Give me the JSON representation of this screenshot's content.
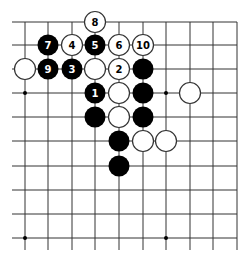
{
  "diagram": {
    "type": "go-board-fragment",
    "grid": {
      "columns_x": [
        25,
        48,
        72,
        95,
        119,
        143,
        166,
        190,
        213,
        237
      ],
      "rows_y": [
        22,
        45,
        69,
        93,
        117,
        141,
        166,
        190,
        214,
        238
      ],
      "line_extend_left": 12,
      "line_extend_bottom": 250,
      "line_color": "#333333"
    },
    "star_points": [
      {
        "col": 0,
        "row": 3
      },
      {
        "col": 6,
        "row": 3
      },
      {
        "col": 0,
        "row": 9
      },
      {
        "col": 6,
        "row": 9
      }
    ],
    "stones": [
      {
        "color": "white",
        "col": 3,
        "row": 0,
        "label": "8"
      },
      {
        "color": "black",
        "col": 1,
        "row": 1,
        "label": "7"
      },
      {
        "color": "white",
        "col": 2,
        "row": 1,
        "label": "4"
      },
      {
        "color": "black",
        "col": 3,
        "row": 1,
        "label": "5"
      },
      {
        "color": "white",
        "col": 4,
        "row": 1,
        "label": "6"
      },
      {
        "color": "white",
        "col": 5,
        "row": 1,
        "label": "10"
      },
      {
        "color": "white",
        "col": 0,
        "row": 2,
        "label": ""
      },
      {
        "color": "black",
        "col": 1,
        "row": 2,
        "label": "9"
      },
      {
        "color": "black",
        "col": 2,
        "row": 2,
        "label": "3"
      },
      {
        "color": "white",
        "col": 3,
        "row": 2,
        "label": ""
      },
      {
        "color": "white",
        "col": 4,
        "row": 2,
        "label": "2"
      },
      {
        "color": "black",
        "col": 5,
        "row": 2,
        "label": ""
      },
      {
        "color": "black",
        "col": 3,
        "row": 3,
        "label": "1"
      },
      {
        "color": "white",
        "col": 4,
        "row": 3,
        "label": ""
      },
      {
        "color": "black",
        "col": 5,
        "row": 3,
        "label": ""
      },
      {
        "color": "white",
        "col": 7,
        "row": 3,
        "label": ""
      },
      {
        "color": "black",
        "col": 3,
        "row": 4,
        "label": ""
      },
      {
        "color": "white",
        "col": 4,
        "row": 4,
        "label": ""
      },
      {
        "color": "black",
        "col": 5,
        "row": 4,
        "label": ""
      },
      {
        "color": "black",
        "col": 4,
        "row": 5,
        "label": ""
      },
      {
        "color": "white",
        "col": 5,
        "row": 5,
        "label": ""
      },
      {
        "color": "white",
        "col": 6,
        "row": 5,
        "label": ""
      },
      {
        "color": "black",
        "col": 4,
        "row": 6,
        "label": ""
      }
    ],
    "colors": {
      "black_stone": "#000000",
      "white_stone": "#ffffff",
      "white_stone_edge": "#333333",
      "black_label": "#ffffff",
      "white_label": "#000000"
    }
  }
}
